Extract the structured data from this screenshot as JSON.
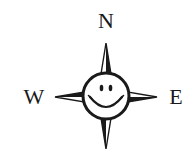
{
  "compass": {
    "north_label": "N",
    "west_label": "W",
    "east_label": "E",
    "center_icon": "smiley-face-icon",
    "colors": {
      "ink": "#1a1a1a",
      "background": "#ffffff"
    }
  }
}
